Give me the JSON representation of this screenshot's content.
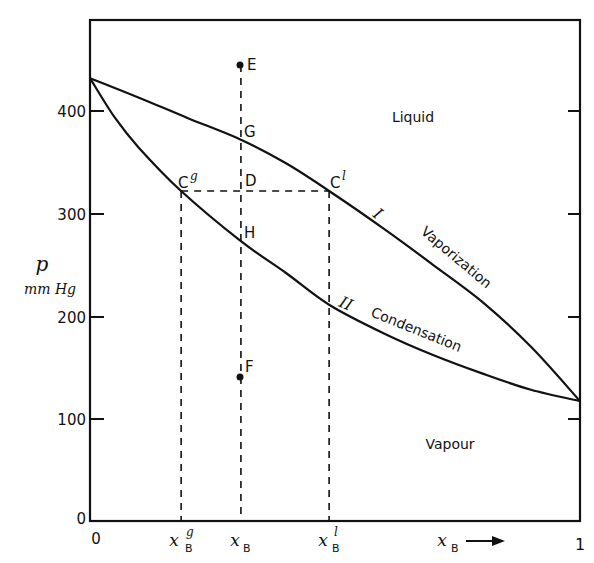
{
  "chart_data": {
    "type": "line",
    "title": "",
    "xlabel": "x_B",
    "xlabel_arrow": "→",
    "ylabel": "p",
    "ylabel_units": "mm Hg",
    "xlim": [
      0,
      1
    ],
    "ylim": [
      0,
      490
    ],
    "grid": false,
    "legend": "none",
    "x_ticks": [
      {
        "label": "0",
        "value": 0
      },
      {
        "label": "x_B^g",
        "value": 0.186
      },
      {
        "label": "x_B",
        "value": 0.308
      },
      {
        "label": "x_B^l",
        "value": 0.488
      },
      {
        "label": "1",
        "value": 1
      }
    ],
    "y_ticks": [
      0,
      100,
      200,
      300,
      400
    ],
    "y_tick_labels": [
      "0",
      "100",
      "200",
      "300",
      "400"
    ],
    "series": [
      {
        "name": "I Vaporization",
        "roman": "I",
        "label": "Vaporization",
        "x": [
          0,
          0.1,
          0.2,
          0.308,
          0.4,
          0.488,
          0.6,
          0.7,
          0.8,
          0.9,
          1.0
        ],
        "p": [
          432,
          413,
          393,
          372,
          349,
          322,
          285,
          250,
          214,
          170,
          117
        ]
      },
      {
        "name": "II Condensation",
        "roman": "II",
        "label": "Condensation",
        "x": [
          0,
          0.05,
          0.1,
          0.186,
          0.308,
          0.4,
          0.488,
          0.6,
          0.7,
          0.8,
          0.9,
          1.0
        ],
        "p": [
          432,
          394,
          364,
          322,
          273,
          242,
          211,
          183,
          162,
          144,
          128,
          117
        ]
      }
    ],
    "points": [
      {
        "label": "E",
        "x": 0.308,
        "p": 445,
        "marker": true
      },
      {
        "label": "G",
        "x": 0.308,
        "p": 372,
        "marker": false
      },
      {
        "label": "D",
        "x": 0.308,
        "p": 322,
        "marker": false
      },
      {
        "label": "H",
        "x": 0.308,
        "p": 273,
        "marker": false
      },
      {
        "label": "F",
        "x": 0.308,
        "p": 140,
        "marker": true
      },
      {
        "label": "C",
        "sup": "g",
        "x": 0.186,
        "p": 322,
        "marker": false
      },
      {
        "label": "C",
        "sup": "l",
        "x": 0.488,
        "p": 322,
        "marker": false
      }
    ],
    "annotations": [
      {
        "text": "Liquid",
        "region": "above curve I"
      },
      {
        "text": "Vapour",
        "region": "below curve II"
      }
    ],
    "dashed_lines": [
      {
        "from": {
          "x": 0.308,
          "p": 445
        },
        "to": {
          "x": 0.308,
          "p": 0
        }
      },
      {
        "from": {
          "x": 0.186,
          "p": 322
        },
        "to": {
          "x": 0.488,
          "p": 322
        }
      },
      {
        "from": {
          "x": 0.186,
          "p": 322
        },
        "to": {
          "x": 0.186,
          "p": 0
        }
      },
      {
        "from": {
          "x": 0.488,
          "p": 322
        },
        "to": {
          "x": 0.488,
          "p": 0
        }
      }
    ]
  },
  "labels": {
    "y_p": "p",
    "y_units": "mm Hg",
    "x_axis": "x",
    "x_axis_sub": "B",
    "arrow": "⟶",
    "liquid": "Liquid",
    "vapour": "Vapour",
    "curve1_roman": "I",
    "curve1_name": "Vaporization",
    "curve2_roman": "II",
    "curve2_name": "Condensation",
    "E": "E",
    "G": "G",
    "D": "D",
    "H": "H",
    "F": "F",
    "Cg": "C",
    "Cg_sup": "g",
    "Cl": "C",
    "Cl_sup": "l",
    "xBg": "x",
    "xBg_sub": "B",
    "xBg_sup": "g",
    "xB": "x",
    "xB_sub": "B",
    "xBl": "x",
    "xBl_sub": "B",
    "xBl_sup": "l",
    "x0": "0",
    "x1": "1",
    "y0": "0",
    "y100": "100",
    "y200": "200",
    "y300": "300",
    "y400": "400"
  }
}
